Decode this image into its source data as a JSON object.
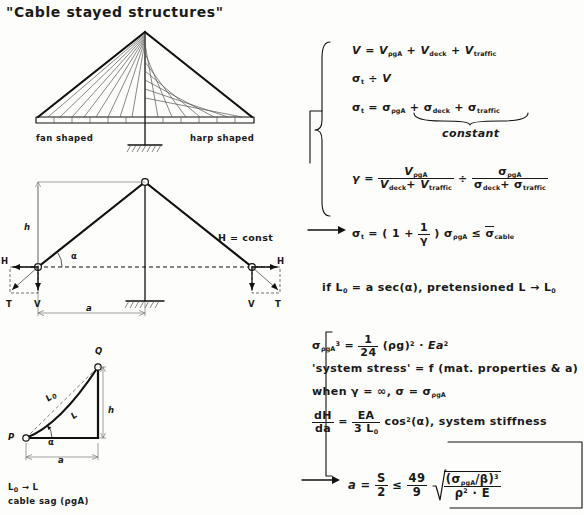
{
  "title": "\"Cable stayed structures\"",
  "bridge_diagram": {
    "left_label": "fan shaped",
    "right_label": "harp shaped"
  },
  "truss_diagram": {
    "height_label": "h",
    "span_label": "a",
    "angle_label": "α",
    "left_H": "H",
    "right_H": "H",
    "left_T": "T",
    "right_T": "T",
    "left_V": "V",
    "right_V": "V",
    "const_note": "H = const"
  },
  "triangle_diagram": {
    "point_p": "P",
    "point_q": "Q",
    "side_L0": "L",
    "side_L0_sub": "0",
    "side_L": "L",
    "height_label": "h",
    "base_label": "a",
    "angle_label": "α",
    "caption_line1_a": "L",
    "caption_line1_sub": "0",
    "caption_line1_b": "→ L",
    "caption_line2": "cable sag (ρgA)"
  },
  "equations": {
    "eq1": {
      "lhs": "V",
      "eq": "=",
      "t1": "V",
      "t1s": "ρgA",
      "t2": "V",
      "t2s": "deck",
      "t3": "V",
      "t3s": "traffic",
      "plus": "+"
    },
    "eq2": {
      "lhs": "σ",
      "lhs_sub": "t",
      "op": "÷",
      "rhs": "V"
    },
    "eq3": {
      "lhs": "σ",
      "lhs_sub": "t",
      "eq": "=",
      "t1": "σ",
      "t1s": "ρgA",
      "t2": "σ",
      "t2s": "deck",
      "t3": "σ",
      "t3s": "traffic",
      "plus": "+",
      "brace_label": "constant"
    },
    "eq4": {
      "lhs": "γ",
      "eq": "=",
      "num1": "V",
      "num1s": "ρgA",
      "den1a": "V",
      "den1as": "deck",
      "den1b": "V",
      "den1bs": "traffic",
      "op": "÷",
      "num2": "σ",
      "num2s": "ρgA",
      "den2a": "σ",
      "den2as": "deck",
      "den2b": "σ",
      "den2bs": "traffic",
      "plus": "+"
    },
    "eq5": {
      "lhs": "σ",
      "lhs_sub": "t",
      "eq": "=",
      "open": "( 1 +",
      "fn": "1",
      "fd": "γ",
      "close": ")",
      "sigma": "σ",
      "sigma_sub": "ρgA",
      "le": "≤",
      "bound": "σ",
      "bound_sub": "cable"
    },
    "eq6": "if L",
    "eq6_sub": "0",
    "eq6_rest": "= a sec(α),  pretensioned L → L",
    "eq6_rest_sub": "0",
    "eq7": {
      "lhs": "σ",
      "lhs_sub": "ρgA",
      "lhs_sup": "3",
      "eq": "=",
      "fn": "1",
      "fd": "24",
      "rho": "(ρg)",
      "rho_sup": "2",
      "dot": "·",
      "ea": "Ea",
      "ea_sup": "2"
    },
    "eq8": "'system stress' = f (mat. properties & a)",
    "eq9_a": "when γ = ∞,  σ = σ",
    "eq9_sub": "ρgA",
    "eq10": {
      "ln": "dH",
      "ld": "da",
      "eq": "=",
      "rn": "EA",
      "rd": "3 L",
      "rd_sub": "0",
      "cos": "cos",
      "cos_sup": "2",
      "alpha": "(α),",
      "note": "system stiffness"
    },
    "eq11": {
      "lhs": "a",
      "eq": "=",
      "sn": "S",
      "sd": "2",
      "le": "≤",
      "fn": "49",
      "fd": "9",
      "radical_num": "(σ",
      "radical_num_sub": "ρgA",
      "radical_num_b": "/β)",
      "radical_num_sup": "3",
      "radical_den": "ρ",
      "radical_den_sup": "2",
      "radical_den_b": "· E"
    }
  },
  "colors": {
    "ink": "#111111",
    "paper": "#fdfdfb",
    "light": "#555555"
  }
}
